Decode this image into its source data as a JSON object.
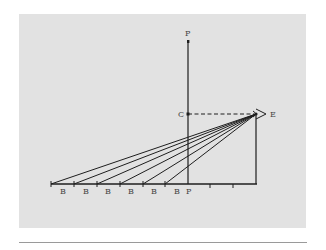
{
  "diagram": {
    "colors": {
      "background": "#ffffff",
      "panel": "#e2e2e2",
      "ink": "#1e1e1e",
      "label": "#444444",
      "rule": "#9a9a9a"
    },
    "labels": {
      "picture_plane_top": "P",
      "center": "C",
      "eye": "E",
      "picture_plane_base": "P"
    },
    "baseline_points": [
      {
        "label": "B"
      },
      {
        "label": "B"
      },
      {
        "label": "B"
      },
      {
        "label": "B"
      },
      {
        "label": "B"
      },
      {
        "label": "B"
      }
    ]
  }
}
